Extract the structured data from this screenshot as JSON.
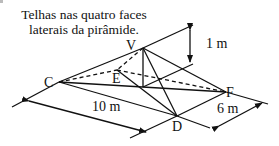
{
  "caption": {
    "line1": "Telhas nas quatro faces",
    "line2": "laterais da pirâmide."
  },
  "vertices": {
    "V": "V",
    "C": "C",
    "E": "E",
    "F": "F",
    "D": "D"
  },
  "dimensions": {
    "height": "1 m",
    "length": "10 m",
    "width": "6 m"
  },
  "colors": {
    "stroke": "#111111",
    "background": "#ffffff"
  }
}
